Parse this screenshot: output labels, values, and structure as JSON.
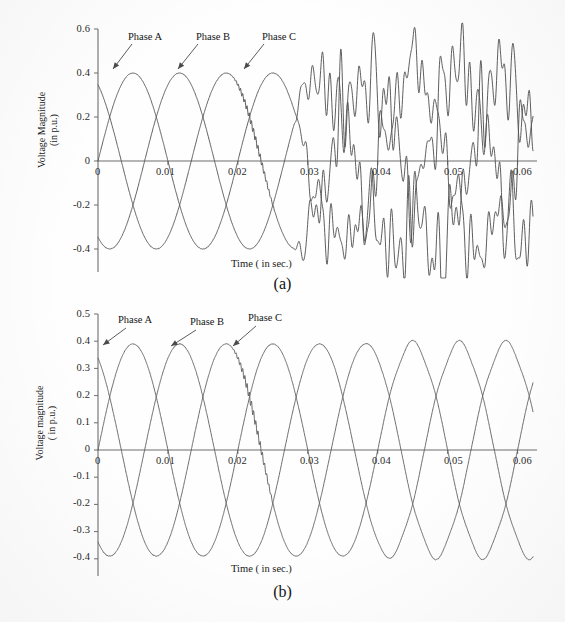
{
  "document": {
    "kind": "scanned-figure",
    "background_color": "#fefefe",
    "ink_color": "#555555"
  },
  "figures": [
    {
      "id": "a",
      "caption": "(a)",
      "xlabel": "Time ( in sec.)",
      "ylabel_line1": "Voltage Magnitude",
      "ylabel_line2": "(in p.u.)",
      "x_ticks": [
        "0",
        "0.01",
        "0.02",
        "0.03",
        "0.04",
        "0.05",
        "0.06"
      ],
      "y_ticks": [
        "0.6",
        "0.4",
        "0.2",
        "0",
        "-0.2",
        "-0.4"
      ],
      "annotations": [
        {
          "label": "Phase A"
        },
        {
          "label": "Phase B"
        },
        {
          "label": "Phase C"
        }
      ]
    },
    {
      "id": "b",
      "caption": "(b)",
      "xlabel": "Time ( in sec.)",
      "ylabel_line1": "Voltage magnitude",
      "ylabel_line2": "( in p.u.)",
      "x_ticks": [
        "0",
        "0.01",
        "0.02",
        "0.03",
        "0.04",
        "0.05",
        "0.06"
      ],
      "y_ticks": [
        "0.5",
        "0.4",
        "0.3",
        "0.2",
        "0.1",
        "0",
        "-0.1",
        "-0.2",
        "-0.3",
        "-0.4"
      ],
      "annotations": [
        {
          "label": "Phase A"
        },
        {
          "label": "Phase B"
        },
        {
          "label": "Phase C"
        }
      ]
    }
  ],
  "chart_data": [
    {
      "type": "line",
      "id": "a",
      "title": "(a)",
      "xlabel": "Time ( in sec.)",
      "ylabel": "Voltage Magnitude (in p.u.)",
      "xlim": [
        0,
        0.062
      ],
      "ylim": [
        -0.48,
        0.6
      ],
      "xticks": [
        0,
        0.01,
        0.02,
        0.03,
        0.04,
        0.05,
        0.06
      ],
      "yticks": [
        0.6,
        0.4,
        0.2,
        0,
        -0.2,
        -0.4
      ],
      "grid": false,
      "legend": "inline-annotations",
      "description": "Three-phase voltage waveforms, amplitude ~0.40 p.u., fundamental 50 Hz (20 ms period). Clean sinusoids until about t=0.02 s where a small high-frequency ripple appears on one phase; after t=0.028 s all three phases become severely harmonically distorted with large jagged oscillations persisting to t=0.06 s.",
      "series": [
        {
          "name": "Phase A",
          "amplitude": 0.4,
          "frequency_hz": 50,
          "phase_deg": 0,
          "distortion_start_s": 0.028,
          "distortion_level": 0.13
        },
        {
          "name": "Phase B",
          "amplitude": 0.4,
          "frequency_hz": 50,
          "phase_deg": -120,
          "distortion_start_s": 0.028,
          "distortion_level": 0.13
        },
        {
          "name": "Phase C",
          "amplitude": 0.4,
          "frequency_hz": 50,
          "phase_deg": 120,
          "ripple_start_s": 0.019,
          "distortion_start_s": 0.028,
          "distortion_level": 0.13
        }
      ]
    },
    {
      "type": "line",
      "id": "b",
      "title": "(b)",
      "xlabel": "Time ( in sec.)",
      "ylabel": "Voltage magnitude ( in p.u.)",
      "xlim": [
        0,
        0.062
      ],
      "ylim": [
        -0.45,
        0.5
      ],
      "xticks": [
        0,
        0.01,
        0.02,
        0.03,
        0.04,
        0.05,
        0.06
      ],
      "yticks": [
        0.5,
        0.4,
        0.3,
        0.2,
        0.1,
        0,
        -0.1,
        -0.2,
        -0.3,
        -0.4
      ],
      "grid": false,
      "legend": "inline-annotations",
      "description": "Three-phase voltage waveforms after compensation, amplitude ~0.39 p.u., fundamental 50 Hz. Waveforms remain essentially sinusoidal over the whole 0 to 0.06 s window with only a faint ripple near t=0.02 s and slightly flattened crests after t=0.04 s.",
      "series": [
        {
          "name": "Phase A",
          "amplitude": 0.39,
          "frequency_hz": 50,
          "phase_deg": 0,
          "distortion_level": 0.012
        },
        {
          "name": "Phase B",
          "amplitude": 0.39,
          "frequency_hz": 50,
          "phase_deg": -120,
          "distortion_level": 0.012
        },
        {
          "name": "Phase C",
          "amplitude": 0.39,
          "frequency_hz": 50,
          "phase_deg": 120,
          "ripple_start_s": 0.019,
          "distortion_level": 0.012
        }
      ]
    }
  ]
}
